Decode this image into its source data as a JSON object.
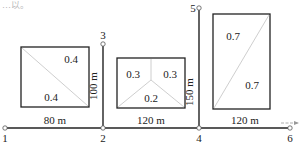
{
  "header": {
    "cropped_text": "…以。"
  },
  "nodes": [
    {
      "id": "1",
      "label": "1",
      "x": 5,
      "y": 128,
      "label_x": 5,
      "label_y": 142
    },
    {
      "id": "2",
      "label": "2",
      "x": 103,
      "y": 128,
      "label_x": 103,
      "label_y": 142
    },
    {
      "id": "3",
      "label": "3",
      "x": 103,
      "y": 44,
      "label_x": 103,
      "label_y": 39
    },
    {
      "id": "4",
      "label": "4",
      "x": 199,
      "y": 128,
      "label_x": 199,
      "label_y": 142
    },
    {
      "id": "5",
      "label": "5",
      "x": 199,
      "y": 8,
      "label_x": 192,
      "label_y": 12
    },
    {
      "id": "6",
      "label": "6",
      "x": 290,
      "y": 128,
      "label_x": 290,
      "label_y": 142
    }
  ],
  "segments": [
    {
      "from": "1",
      "to": "2",
      "length_label": "80 m"
    },
    {
      "from": "2",
      "to": "4",
      "length_label": "120 m"
    },
    {
      "from": "4",
      "to": "6",
      "length_label": "120 m"
    },
    {
      "from": "2",
      "to": "3",
      "length_label": "100 m"
    },
    {
      "from": "4",
      "to": "5",
      "length_label": "150 m"
    }
  ],
  "flow_direction": {
    "label": "flow-arrow",
    "direction": "right"
  },
  "areas": [
    {
      "name": "left-block",
      "rect": {
        "x": 21,
        "y": 47,
        "w": 68,
        "h": 60
      },
      "split": "diagonal-tl-br",
      "coefficients": [
        "0.4",
        "0.4"
      ]
    },
    {
      "name": "middle-block",
      "rect": {
        "x": 117,
        "y": 58,
        "w": 68,
        "h": 50
      },
      "split": "y-three-way",
      "coefficients": [
        "0.3",
        "0.3",
        "0.2"
      ]
    },
    {
      "name": "right-block",
      "rect": {
        "x": 213,
        "y": 14,
        "w": 57,
        "h": 95
      },
      "split": "diagonal-bl-tr",
      "coefficients": [
        "0.7",
        "0.7"
      ]
    }
  ],
  "colors": {
    "line": "#222222",
    "divider": "#c8c8c8",
    "text": "#222222"
  }
}
